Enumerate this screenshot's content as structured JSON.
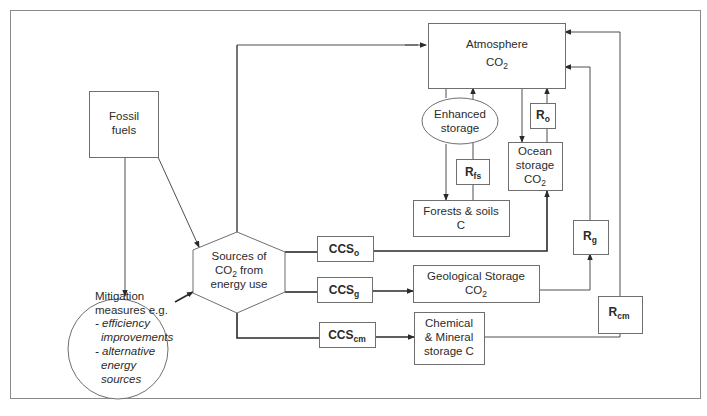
{
  "diagram": {
    "nodes": {
      "atmosphere": {
        "line1": "Atmosphere",
        "line2_main": "CO",
        "line2_sub": "2"
      },
      "fossil_fuels": {
        "line1": "Fossil",
        "line2": "fuels"
      },
      "sources": {
        "line1": "Sources of",
        "line2_main": "CO",
        "line2_sub": "2",
        "line2_rest": " from",
        "line3": "energy use"
      },
      "mitigation": {
        "line1": "Mitigation",
        "line2": "measures e.g.",
        "items": [
          "- efficiency",
          "improvements",
          "- alternative",
          "energy",
          "sources"
        ]
      },
      "enhanced_storage": {
        "line1": "Enhanced",
        "line2": "storage"
      },
      "forests_soils": {
        "line1": "Forests & soils",
        "line2": "C"
      },
      "ocean_storage": {
        "line1": "Ocean",
        "line2": "storage",
        "line3_main": "CO",
        "line3_sub": "2"
      },
      "geological_storage": {
        "line1": "Geological Storage",
        "line2_main": "CO",
        "line2_sub": "2"
      },
      "chemical_mineral": {
        "line1": "Chemical",
        "line2": "& Mineral",
        "line3": "storage C"
      }
    },
    "labels": {
      "ccs_o": {
        "main": "CCS",
        "sub": "o"
      },
      "ccs_g": {
        "main": "CCS",
        "sub": "g"
      },
      "ccs_cm": {
        "main": "CCS",
        "sub": "cm"
      },
      "r_fs": {
        "main": "R",
        "sub": "fs"
      },
      "r_o": {
        "main": "R",
        "sub": "o"
      },
      "r_g": {
        "main": "R",
        "sub": "g"
      },
      "r_cm": {
        "main": "R",
        "sub": "cm"
      }
    },
    "colors": {
      "line": "#3a3a3a",
      "box_border": "#6f6f6f",
      "text": "#2b2b2b",
      "background": "#ffffff"
    }
  }
}
